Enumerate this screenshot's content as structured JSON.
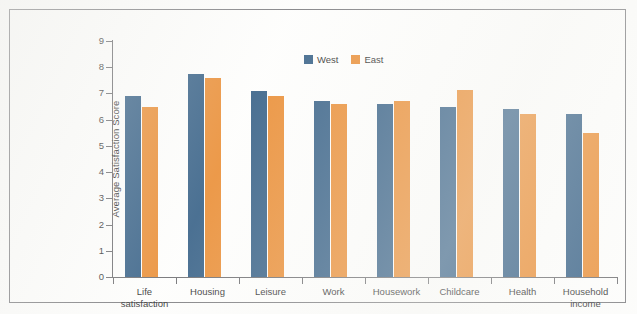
{
  "chart_data": {
    "type": "bar",
    "title": "",
    "subtitle": "",
    "xlabel": "",
    "ylabel": "Average Satisfaction Score",
    "ylim": [
      0,
      9
    ],
    "ytick_labels": [
      "0",
      "1",
      "2",
      "3",
      "4",
      "5",
      "6",
      "7",
      "8",
      "9"
    ],
    "ytick_values": [
      0,
      1,
      2,
      3,
      4,
      5,
      6,
      7,
      8,
      9
    ],
    "grid": false,
    "legend_position": "top-center",
    "categories": [
      "Life\nsatisfaction",
      "Housing",
      "Leisure",
      "Work",
      "Housework",
      "Childcare",
      "Health",
      "Household\nincome"
    ],
    "series": [
      {
        "name": "West",
        "color": "#1f4e79",
        "values": [
          6.9,
          7.75,
          7.1,
          6.7,
          6.6,
          6.5,
          6.4,
          6.2
        ]
      },
      {
        "name": "East",
        "color": "#e8811e",
        "values": [
          6.5,
          7.6,
          6.9,
          6.6,
          6.7,
          7.15,
          6.2,
          5.5
        ]
      }
    ]
  },
  "legend": {
    "items": [
      {
        "label": "West",
        "color": "#1f4e79",
        "swatch": "legend-swatch-west"
      },
      {
        "label": "East",
        "color": "#e8811e",
        "swatch": "legend-swatch-east"
      }
    ]
  },
  "axes": {
    "y_title": "Average Satisfaction Score"
  },
  "colors": {
    "west": "#1f4e79",
    "east": "#e8811e",
    "axis": "#5d5d61",
    "frame": "#6e6e72",
    "background": "#fefefd",
    "text": "#111111"
  }
}
